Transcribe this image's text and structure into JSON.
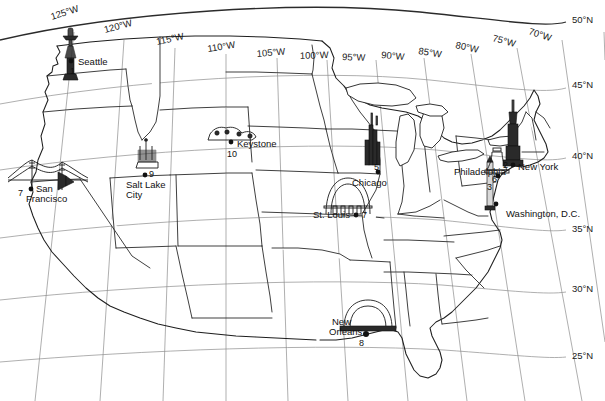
{
  "map": {
    "title": "United States Landmarks Reference Map",
    "projection": "conic",
    "background_color": "#ffffff",
    "outline_color": "#1e1e1e",
    "graticule_color": "#8d8d8d"
  },
  "graticule": {
    "longitude_labels": [
      {
        "label": "125°W",
        "x": 52,
        "y": 16,
        "rotate": -17
      },
      {
        "label": "120°W",
        "x": 107,
        "y": 28,
        "rotate": -14
      },
      {
        "label": "115°W",
        "x": 160,
        "y": 40,
        "rotate": -11
      },
      {
        "label": "110°W",
        "x": 212,
        "y": 46,
        "rotate": -8
      },
      {
        "label": "105°W",
        "x": 261,
        "y": 52,
        "rotate": -5
      },
      {
        "label": "100°W",
        "x": 303,
        "y": 53,
        "rotate": -2
      },
      {
        "label": "95°W",
        "x": 345,
        "y": 54,
        "rotate": 1
      },
      {
        "label": "90°W",
        "x": 384,
        "y": 52,
        "rotate": 4
      },
      {
        "label": "85°W",
        "x": 421,
        "y": 48,
        "rotate": 7
      },
      {
        "label": "80°W",
        "x": 458,
        "y": 43,
        "rotate": 10
      },
      {
        "label": "75°W",
        "x": 495,
        "y": 35,
        "rotate": 13
      },
      {
        "label": "70°W",
        "x": 531,
        "y": 28,
        "rotate": 16
      }
    ],
    "latitude_labels": [
      {
        "label": "50°N",
        "x": 572,
        "y": 19
      },
      {
        "label": "45°N",
        "x": 572,
        "y": 84
      },
      {
        "label": "40°N",
        "x": 572,
        "y": 155
      },
      {
        "label": "35°N",
        "x": 572,
        "y": 228
      },
      {
        "label": "30°N",
        "x": 572,
        "y": 288
      },
      {
        "label": "25°N",
        "x": 572,
        "y": 355
      }
    ]
  },
  "landmarks": [
    {
      "id": 1,
      "number": "1",
      "city": "Seattle",
      "icon": "space-needle-icon",
      "dot_x": 71,
      "dot_y": 61,
      "label_x": 78,
      "label_y": 62,
      "num_x": 72,
      "num_y": 72
    },
    {
      "id": 2,
      "number": "2",
      "city": "New York",
      "icon": "empire-state-building-icon",
      "dot_x": 513,
      "dot_y": 165,
      "label_x": 519,
      "label_y": 169,
      "num_x": 506,
      "num_y": 165
    },
    {
      "id": 3,
      "number": "3",
      "city": "Washington, D.C.",
      "icon": "washington-monument-icon",
      "dot_x": 495,
      "dot_y": 203,
      "label_x": 506,
      "label_y": 215,
      "num_x": 489,
      "num_y": 186
    },
    {
      "id": 4,
      "number": "7",
      "city": "San Francisco",
      "icon": "golden-gate-bridge-icon",
      "dot_x": 33,
      "dot_y": 189,
      "label_x": 37,
      "label_y": 190,
      "num_x": 21,
      "num_y": 193
    },
    {
      "id": 5,
      "number": "5",
      "city": "Chicago",
      "icon": "willis-tower-icon",
      "dot_x": 378,
      "dot_y": 172,
      "label_x": 356,
      "label_y": 184,
      "num_x": 376,
      "num_y": 167
    },
    {
      "id": 6,
      "number": "6",
      "city": "Philadelphia",
      "icon": "liberty-bell-icon",
      "dot_x": 498,
      "dot_y": 176,
      "label_x": 457,
      "label_y": 172,
      "num_x": 494,
      "num_y": 178
    },
    {
      "id": 7,
      "number": "7",
      "city": "St. Louis",
      "icon": "gateway-arch-icon",
      "dot_x": 356,
      "dot_y": 215,
      "label_x": 317,
      "label_y": 216,
      "num_x": 361,
      "num_y": 215
    },
    {
      "id": 8,
      "number": "8",
      "city": "New Orleans",
      "icon": "superdome-icon",
      "dot_x": 366,
      "dot_y": 334,
      "label_x": 334,
      "label_y": 323,
      "num_x": 361,
      "num_y": 345
    },
    {
      "id": 9,
      "number": "9",
      "city": "Salt Lake City",
      "icon": "temple-icon",
      "dot_x": 145,
      "dot_y": 175,
      "label_x": 130,
      "label_y": 186,
      "num_x": 150,
      "num_y": 174
    },
    {
      "id": 10,
      "number": "10",
      "city": "Keystone",
      "icon": "mount-rushmore-icon",
      "dot_x": 231,
      "dot_y": 142,
      "label_x": 237,
      "label_y": 144,
      "num_x": 229,
      "num_y": 155
    }
  ],
  "city_labels": {
    "seattle": "Seattle",
    "new_york": "New York",
    "washington": "Washington, D.C.",
    "san_francisco_line1": "San",
    "san_francisco_line2": "Francisco",
    "chicago": "Chicago",
    "philadelphia": "Philadelphia",
    "st_louis": "St. Louis",
    "new_orleans_line1": "New",
    "new_orleans_line2": "Orleans",
    "salt_lake_line1": "Salt Lake",
    "salt_lake_line2": "City",
    "keystone": "Keystone"
  },
  "numbers": {
    "seattle": "1",
    "new_york": "2",
    "washington": "3",
    "san_francisco": "7",
    "chicago": "5",
    "philadelphia": "6",
    "st_louis": "7",
    "new_orleans": "8",
    "salt_lake_city": "9",
    "keystone": "10"
  }
}
